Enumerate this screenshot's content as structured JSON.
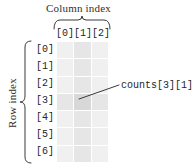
{
  "figure": {
    "column_header": {
      "title": "Column index",
      "labels": [
        "[0]",
        "[1]",
        "[2]"
      ]
    },
    "row_header": {
      "title": "Row index",
      "labels": [
        "[0]",
        "[1]",
        "[2]",
        "[3]",
        "[4]",
        "[5]",
        "[6]"
      ]
    },
    "annotation": {
      "text": "counts[3][1]",
      "points_to_row": 3,
      "points_to_col": 1
    },
    "grid": {
      "rows": 7,
      "columns": 3,
      "highlight_row": 3,
      "highlight_col": 1,
      "cell_color": "#f0f0f0",
      "cell_color_emphasis": "#e6e6e6",
      "cell_color_intersection": "#d8d8d8",
      "background": "#ffffff"
    },
    "ink_color": "#2f2f2f"
  }
}
